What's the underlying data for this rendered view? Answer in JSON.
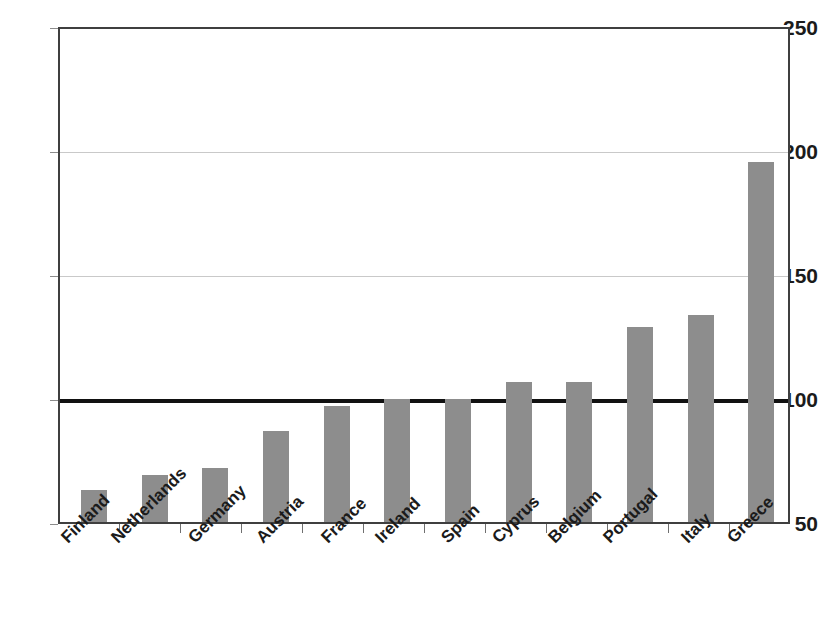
{
  "chart_data": {
    "type": "bar",
    "title": "",
    "subtitle": "",
    "xlabel": "",
    "ylabel": "",
    "categories": [
      "Finland",
      "Netherlands",
      "Germany",
      "Austria",
      "France",
      "Ireland",
      "Spain",
      "Cyprus",
      "Belgium",
      "Portugal",
      "Italy",
      "Greece"
    ],
    "values": [
      63,
      69,
      72,
      87,
      97,
      100,
      100,
      107,
      107,
      129,
      134,
      196
    ],
    "ylim": [
      50,
      250
    ],
    "yticks": [
      50,
      100,
      150,
      200,
      250
    ],
    "ytick_labels": [
      "50",
      "100",
      "150",
      "200",
      "250"
    ],
    "xtick_rotation": -45,
    "grid": "horizontal",
    "legend": "none",
    "reference_line": {
      "value": 100,
      "color": "#111111",
      "width_px": 4
    },
    "bar_color": "#8d8d8d",
    "axis_color": "#3f3f3f",
    "gridline_color": "#c9c9c9",
    "annotations": []
  }
}
